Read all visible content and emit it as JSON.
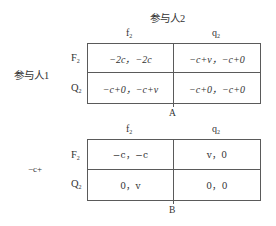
{
  "figure": {
    "top_label": "参与人2",
    "side_label": "参与人1",
    "side_label_b": "−c+"
  },
  "table_a": {
    "caption": "A",
    "columns": [
      {
        "main": "f",
        "sub": "2"
      },
      {
        "main": "q",
        "sub": "2"
      }
    ],
    "rows": [
      {
        "main": "F",
        "sub": "2"
      },
      {
        "main": "Q",
        "sub": "2"
      }
    ],
    "cells": [
      [
        "−2c，−2c",
        "−c+v，−c+0"
      ],
      [
        "−c+0，−c+v",
        "−c+0，−c+0"
      ]
    ]
  },
  "table_b": {
    "caption": "B",
    "columns": [
      {
        "main": "f",
        "sub": "2"
      },
      {
        "main": "q",
        "sub": "2"
      }
    ],
    "rows": [
      {
        "main": "F",
        "sub": "2"
      },
      {
        "main": "Q",
        "sub": "2"
      }
    ],
    "cells": [
      [
        "−c，−c",
        "v，0"
      ],
      [
        "0，v",
        "0，0"
      ]
    ]
  },
  "colors": {
    "line": "#5a5a5a",
    "text": "#333333",
    "background": "#ffffff"
  }
}
